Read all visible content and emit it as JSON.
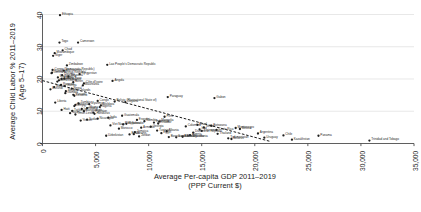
{
  "chart_data": {
    "type": "scatter",
    "title": "",
    "xlabel": "Average Per-capita GDP 2011–2019\n(PPP Current $)",
    "ylabel": "Average Child Labor % 2011–2019\n(Age 5–17)",
    "xlim": [
      0,
      35000
    ],
    "ylim": [
      0,
      40
    ],
    "xticks": [
      "0",
      "5,000",
      "10,000",
      "15,000",
      "20,000",
      "25,000",
      "30,000",
      "35,000"
    ],
    "xtick_values": [
      0,
      5000,
      10000,
      15000,
      20000,
      25000,
      30000,
      35000
    ],
    "yticks": [
      "0",
      "10",
      "20",
      "30",
      "40"
    ],
    "ytick_values": [
      0,
      10,
      20,
      30,
      40
    ],
    "grid": "horizontal",
    "legend": "none",
    "marker_color": "#1f1f1f",
    "trendline": {
      "style": "dashed",
      "color": "#1a1a1a",
      "x_start": 0,
      "y_start": 19.5,
      "x_end": 21500,
      "y_end": 0.6
    },
    "points": [
      {
        "label": "Ethiopia",
        "x": 1650,
        "y": 39.8
      },
      {
        "label": "Cameroon",
        "x": 3350,
        "y": 31.3
      },
      {
        "label": "Togo",
        "x": 1600,
        "y": 31.3
      },
      {
        "label": "Chad",
        "x": 1900,
        "y": 28.9
      },
      {
        "label": "Mozambique",
        "x": 1150,
        "y": 28.0
      },
      {
        "label": "Niger",
        "x": 1000,
        "y": 27.2
      },
      {
        "label": "Zimbabwe",
        "x": 2300,
        "y": 24.2
      },
      {
        "label": "Lao People's Democratic Republic",
        "x": 6100,
        "y": 24.4
      },
      {
        "label": "Uganda",
        "x": 1850,
        "y": 21.2
      },
      {
        "label": "Madagascar",
        "x": 1450,
        "y": 20.5
      },
      {
        "label": "Burkina Faso",
        "x": 1800,
        "y": 20.0
      },
      {
        "label": "Mali",
        "x": 2050,
        "y": 20.1
      },
      {
        "label": "Guinea-Bissau",
        "x": 1550,
        "y": 19.6
      },
      {
        "label": "Sierra Leone",
        "x": 1400,
        "y": 19.2
      },
      {
        "label": "Benin",
        "x": 2900,
        "y": 19.0
      },
      {
        "label": "Côte d'Ivoire",
        "x": 3900,
        "y": 18.6
      },
      {
        "label": "Rwanda",
        "x": 1750,
        "y": 18.2
      },
      {
        "label": "Guinea",
        "x": 2100,
        "y": 17.8
      },
      {
        "label": "Malawi",
        "x": 1100,
        "y": 17.5
      },
      {
        "label": "Nepal",
        "x": 2750,
        "y": 17.0
      },
      {
        "label": "Burundi",
        "x": 750,
        "y": 16.8
      },
      {
        "label": "Paraguay",
        "x": 11800,
        "y": 14.4
      },
      {
        "label": "Gabon",
        "x": 16200,
        "y": 14.1
      },
      {
        "label": "Congo",
        "x": 5200,
        "y": 13.2
      },
      {
        "label": "Bolivia (Plurinational State of)",
        "x": 6800,
        "y": 13.0
      },
      {
        "label": "Liberia",
        "x": 1200,
        "y": 12.7
      },
      {
        "label": "Zambia",
        "x": 3400,
        "y": 12.4
      },
      {
        "label": "Senegal",
        "x": 3100,
        "y": 12.0
      },
      {
        "label": "Kenya",
        "x": 3000,
        "y": 11.6
      },
      {
        "label": "Nigeria",
        "x": 5400,
        "y": 11.3
      },
      {
        "label": "Ghana",
        "x": 4200,
        "y": 11.0
      },
      {
        "label": "Cambodia",
        "x": 3700,
        "y": 10.7
      },
      {
        "label": "Haiti",
        "x": 1800,
        "y": 10.4
      },
      {
        "label": "Bangladesh",
        "x": 3900,
        "y": 10.0
      },
      {
        "label": "Pakistan",
        "x": 4800,
        "y": 9.6
      },
      {
        "label": "Honduras",
        "x": 4900,
        "y": 9.2
      },
      {
        "label": "Timor-Leste",
        "x": 3100,
        "y": 9.0
      },
      {
        "label": "Guatemala",
        "x": 7500,
        "y": 8.6
      },
      {
        "label": "Peru",
        "x": 11500,
        "y": 8.3
      },
      {
        "label": "India",
        "x": 6200,
        "y": 8.0
      },
      {
        "label": "Nicaragua",
        "x": 5200,
        "y": 7.7
      },
      {
        "label": "Sudan",
        "x": 4200,
        "y": 7.4
      },
      {
        "label": "Yemen",
        "x": 3600,
        "y": 7.1
      },
      {
        "label": "Mongolia",
        "x": 11000,
        "y": 6.8
      },
      {
        "label": "Indonesia",
        "x": 10500,
        "y": 6.5
      },
      {
        "label": "Ecuador",
        "x": 10900,
        "y": 6.2
      },
      {
        "label": "Panama",
        "x": 26000,
        "y": 2.4
      },
      {
        "label": "Chile",
        "x": 22700,
        "y": 2.5
      },
      {
        "label": "Trinidad and Tobago",
        "x": 30800,
        "y": 0.9
      },
      {
        "label": "Serbia",
        "x": 15200,
        "y": 5.0
      },
      {
        "label": "Montenegro",
        "x": 18200,
        "y": 4.8
      },
      {
        "label": "Costa Rica",
        "x": 16400,
        "y": 4.2
      },
      {
        "label": "Mexico",
        "x": 18600,
        "y": 4.5
      },
      {
        "label": "Colombia",
        "x": 13500,
        "y": 5.3
      },
      {
        "label": "Tunisia",
        "x": 10800,
        "y": 4.0
      },
      {
        "label": "Albania",
        "x": 11700,
        "y": 3.8
      },
      {
        "label": "Jamaica",
        "x": 8700,
        "y": 3.5
      },
      {
        "label": "Egypt",
        "x": 11200,
        "y": 3.2
      },
      {
        "label": "Viet Nam",
        "x": 6400,
        "y": 5.6
      },
      {
        "label": "Philippines",
        "x": 7600,
        "y": 5.9
      },
      {
        "label": "Morocco",
        "x": 7200,
        "y": 4.6
      },
      {
        "label": "El Salvador",
        "x": 7900,
        "y": 6.1
      },
      {
        "label": "Iraq",
        "x": 14800,
        "y": 4.4
      },
      {
        "label": "Armenia",
        "x": 9300,
        "y": 4.9
      },
      {
        "label": "Georgia",
        "x": 10200,
        "y": 5.2
      },
      {
        "label": "Ukraine",
        "x": 8600,
        "y": 2.9
      },
      {
        "label": "Thailand",
        "x": 16500,
        "y": 3.0
      },
      {
        "label": "Dominican Republic",
        "x": 14200,
        "y": 3.4
      },
      {
        "label": "Algeria",
        "x": 13900,
        "y": 2.6
      },
      {
        "label": "Jordan",
        "x": 9100,
        "y": 2.2
      },
      {
        "label": "Bosnia and Herzegovina",
        "x": 11900,
        "y": 2.0
      },
      {
        "label": "North Macedonia",
        "x": 13200,
        "y": 2.1
      },
      {
        "label": "Belize",
        "x": 8200,
        "y": 2.8
      },
      {
        "label": "Lesotho",
        "x": 3000,
        "y": 14.8
      },
      {
        "label": "Gambia",
        "x": 2150,
        "y": 15.6
      },
      {
        "label": "Tanzania",
        "x": 2450,
        "y": 20.8
      },
      {
        "label": "Somalia",
        "x": 900,
        "y": 22.0
      },
      {
        "label": "Afghanistan",
        "x": 2000,
        "y": 22.6
      },
      {
        "label": "Angola",
        "x": 6600,
        "y": 19.4
      },
      {
        "label": "Myanmar",
        "x": 4400,
        "y": 12.2
      },
      {
        "label": "Namibia",
        "x": 9600,
        "y": 6.9
      },
      {
        "label": "Botswana",
        "x": 15900,
        "y": 5.5
      },
      {
        "label": "Eswatini",
        "x": 8900,
        "y": 7.3
      },
      {
        "label": "Suriname",
        "x": 15000,
        "y": 3.9
      },
      {
        "label": "Argentina",
        "x": 20300,
        "y": 3.1
      },
      {
        "label": "Uruguay",
        "x": 20900,
        "y": 1.8
      },
      {
        "label": "Kazakhstan",
        "x": 23500,
        "y": 1.2
      },
      {
        "label": "Turkmenistan",
        "x": 17500,
        "y": 1.6
      },
      {
        "label": "Belarus",
        "x": 17800,
        "y": 1.4
      },
      {
        "label": "Brazil",
        "x": 14600,
        "y": 5.8
      },
      {
        "label": "South Africa",
        "x": 12600,
        "y": 1.9
      },
      {
        "label": "Kyrgyzstan",
        "x": 3500,
        "y": 21.5
      },
      {
        "label": "Tajikistan",
        "x": 2800,
        "y": 10.1
      },
      {
        "label": "Uzbekistan",
        "x": 6000,
        "y": 2.4
      },
      {
        "label": "Moldova",
        "x": 5500,
        "y": 11.8
      },
      {
        "label": "Nauru",
        "x": 2600,
        "y": 9.4
      },
      {
        "label": "Vanuatu",
        "x": 2900,
        "y": 15.1
      },
      {
        "label": "Solomon Islands",
        "x": 2200,
        "y": 16.2
      },
      {
        "label": "Mauritania",
        "x": 3800,
        "y": 18.0
      },
      {
        "label": "Central African Republic",
        "x": 850,
        "y": 21.8
      },
      {
        "label": "Congo (Democratic Republic)",
        "x": 950,
        "y": 22.8
      },
      {
        "label": "Guyana",
        "x": 7800,
        "y": 12.8
      }
    ]
  }
}
